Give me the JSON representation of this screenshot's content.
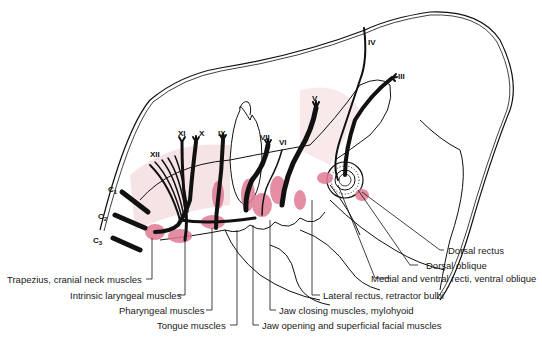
{
  "figure": {
    "colors": {
      "outline": "#111111",
      "muscle_highlight": "#e07a93",
      "muscle_shade": "#f6e3e6",
      "background": "#ffffff"
    }
  },
  "cranial_nerves": [
    {
      "id": "III",
      "label": "III"
    },
    {
      "id": "IV",
      "label": "IV"
    },
    {
      "id": "V",
      "label": "V"
    },
    {
      "id": "VI",
      "label": "VI"
    },
    {
      "id": "VII",
      "label": "VII"
    },
    {
      "id": "IX",
      "label": "IX"
    },
    {
      "id": "X",
      "label": "X"
    },
    {
      "id": "XI",
      "label": "XI"
    },
    {
      "id": "XII",
      "label": "XII"
    }
  ],
  "cervical_nerves": [
    {
      "id": "C1",
      "label": "C",
      "sub": "1"
    },
    {
      "id": "C2",
      "label": "C",
      "sub": "2"
    },
    {
      "id": "C3",
      "label": "C",
      "sub": "3"
    }
  ],
  "muscle_labels": [
    {
      "id": "trapezius",
      "text": "Trapezius, cranial neck muscles"
    },
    {
      "id": "intrinsic-laryngeal",
      "text": "Intrinsic laryngeal muscles"
    },
    {
      "id": "pharyngeal",
      "text": "Pharyngeal muscles"
    },
    {
      "id": "tongue",
      "text": "Tongue muscles"
    },
    {
      "id": "jaw-opening",
      "text": "Jaw opening and superficial facial muscles"
    },
    {
      "id": "jaw-closing",
      "text": "Jaw closing muscles, mylohyoid"
    },
    {
      "id": "lateral-rectus",
      "text": "Lateral rectus, retractor bulbi"
    },
    {
      "id": "medial-ventral",
      "text": "Medial and ventral recti, ventral oblique"
    },
    {
      "id": "dorsal-oblique",
      "text": "Dorsal oblique"
    },
    {
      "id": "dorsal-rectus",
      "text": "Dorsal rectus"
    }
  ]
}
